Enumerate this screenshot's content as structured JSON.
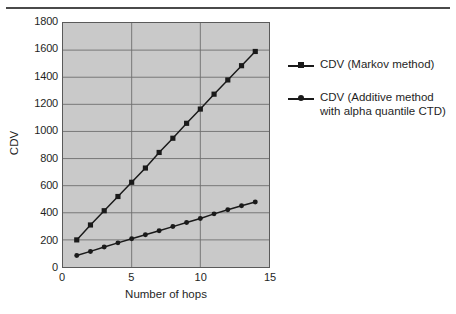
{
  "figure": {
    "background_color": "#ffffff",
    "plot_background_color": "#c9c9c9",
    "axis_color": "#5a5a5a",
    "series_color": "#1a1a1a",
    "top_rule": "horizontal-rule"
  },
  "chart_data": {
    "type": "line",
    "title": "",
    "xlabel": "Number of hops",
    "ylabel": "CDV",
    "xlim": [
      0,
      15
    ],
    "ylim": [
      0,
      1800
    ],
    "xticks": [
      0,
      5,
      10,
      15
    ],
    "yticks": [
      0,
      200,
      400,
      600,
      800,
      1000,
      1200,
      1400,
      1600,
      1800
    ],
    "grid": "both",
    "legend_position": "right",
    "x": [
      1,
      2,
      3,
      4,
      5,
      6,
      7,
      8,
      9,
      10,
      11,
      12,
      13,
      14
    ],
    "series": [
      {
        "name": "CDV (Markov method)",
        "marker": "square",
        "values": [
          200,
          310,
          415,
          520,
          625,
          730,
          845,
          950,
          1060,
          1165,
          1275,
          1380,
          1485,
          1590
        ]
      },
      {
        "name": "CDV (Additive method\nwith alpha quantile CTD)",
        "marker": "circle",
        "values": [
          85,
          115,
          148,
          178,
          208,
          238,
          268,
          298,
          328,
          358,
          392,
          422,
          452,
          480
        ]
      }
    ]
  },
  "legend": {
    "entries": [
      {
        "label": "CDV (Markov method)",
        "marker": "square-marker"
      },
      {
        "label": "CDV (Additive method\nwith alpha quantile CTD)",
        "marker": "circle-marker"
      }
    ]
  },
  "axes": {
    "y_tick_labels": [
      "1800",
      "1600",
      "1400",
      "1200",
      "1000",
      "800",
      "600",
      "400",
      "200",
      "0"
    ],
    "x_tick_labels": [
      "0",
      "5",
      "10",
      "15"
    ],
    "x_title": "Number of hops",
    "y_title": "CDV"
  }
}
